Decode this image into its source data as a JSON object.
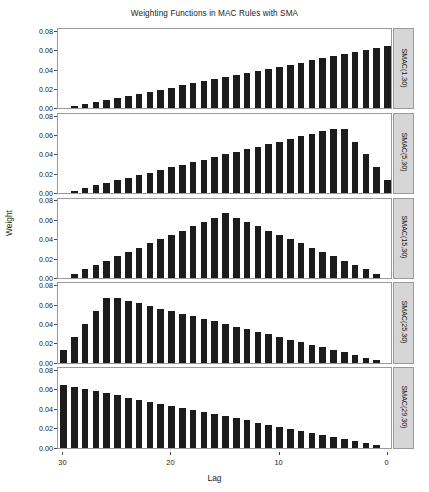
{
  "chart_data": {
    "type": "bar",
    "title": "Weighting Functions in MAC Rules with SMA",
    "xlabel": "Lag",
    "ylabel": "Weight",
    "layout": "5 stacked panels, shared x axis, shared y axis",
    "grid": false,
    "legend": "none",
    "x_reversed": true,
    "xlim": [
      30.5,
      -0.5
    ],
    "ylim": [
      0.0,
      0.082
    ],
    "xticks": [
      30,
      20,
      10,
      0
    ],
    "yticks": [
      "0.00",
      "0.02",
      "0.04",
      "0.06",
      "0.08"
    ],
    "ytick_values": [
      0.0,
      0.02,
      0.04,
      0.06,
      0.08
    ],
    "x": [
      30,
      29,
      28,
      27,
      26,
      25,
      24,
      23,
      22,
      21,
      20,
      19,
      18,
      17,
      16,
      15,
      14,
      13,
      12,
      11,
      10,
      9,
      8,
      7,
      6,
      5,
      4,
      3,
      2,
      1,
      0
    ],
    "panels": [
      {
        "label": "SMAC(1,30)",
        "peak_value": 0.0645,
        "peak_lag": 0,
        "values": [
          0.0,
          0.0022,
          0.0043,
          0.0065,
          0.0086,
          0.0108,
          0.0129,
          0.0151,
          0.0172,
          0.0194,
          0.0215,
          0.0237,
          0.0258,
          0.028,
          0.0301,
          0.0323,
          0.0344,
          0.0366,
          0.0387,
          0.0409,
          0.043,
          0.0452,
          0.0473,
          0.0495,
          0.0516,
          0.0538,
          0.0559,
          0.0581,
          0.0602,
          0.0624,
          0.0645
        ]
      },
      {
        "label": "SMAC(5,30)",
        "peak_value": 0.0667,
        "peak_lag": 4,
        "values": [
          0.0,
          0.0027,
          0.0053,
          0.008,
          0.0107,
          0.0133,
          0.016,
          0.0187,
          0.0213,
          0.024,
          0.0267,
          0.0293,
          0.032,
          0.0347,
          0.0373,
          0.04,
          0.0427,
          0.0453,
          0.048,
          0.0507,
          0.0533,
          0.056,
          0.0587,
          0.0613,
          0.064,
          0.0667,
          0.0667,
          0.0533,
          0.04,
          0.0267,
          0.0133
        ]
      },
      {
        "label": "SMAC(15,30)",
        "peak_value": 0.0667,
        "peak_lag": 15,
        "values": [
          0.0,
          0.0044,
          0.0089,
          0.0133,
          0.0178,
          0.0222,
          0.0267,
          0.0311,
          0.0356,
          0.04,
          0.0444,
          0.0489,
          0.0533,
          0.0578,
          0.0622,
          0.0667,
          0.0622,
          0.0578,
          0.0533,
          0.0489,
          0.0444,
          0.04,
          0.0356,
          0.0311,
          0.0267,
          0.0222,
          0.0178,
          0.0133,
          0.0089,
          0.0044,
          0.0
        ]
      },
      {
        "label": "SMAC(25,30)",
        "peak_value": 0.0667,
        "peak_lag": 26,
        "values": [
          0.0133,
          0.0267,
          0.04,
          0.0533,
          0.0667,
          0.0667,
          0.064,
          0.0613,
          0.0587,
          0.056,
          0.0533,
          0.0507,
          0.048,
          0.0453,
          0.0427,
          0.04,
          0.0373,
          0.0347,
          0.032,
          0.0293,
          0.0267,
          0.024,
          0.0213,
          0.0187,
          0.016,
          0.0133,
          0.0107,
          0.008,
          0.0053,
          0.0027,
          0.0
        ]
      },
      {
        "label": "SMAC(29,30)",
        "peak_value": 0.0645,
        "peak_lag": 30,
        "values": [
          0.0645,
          0.0624,
          0.0602,
          0.0581,
          0.0559,
          0.0538,
          0.0516,
          0.0495,
          0.0473,
          0.0452,
          0.043,
          0.0409,
          0.0387,
          0.0366,
          0.0344,
          0.0323,
          0.0301,
          0.028,
          0.0258,
          0.0237,
          0.0215,
          0.0194,
          0.0172,
          0.0151,
          0.0129,
          0.0108,
          0.0086,
          0.0065,
          0.0043,
          0.0022,
          0.0
        ]
      }
    ]
  },
  "colors": {
    "bar": "#1c1c1c",
    "strip_background": "#d6d6d6",
    "panel_border": "#9a9a9a",
    "text": "#1a1a1a",
    "background": "#ffffff"
  }
}
